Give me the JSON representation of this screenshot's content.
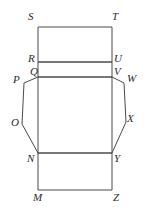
{
  "figure": {
    "stroke_color": "#4a4a4a",
    "label_color": "#2b2b2b",
    "background_color": "#ffffff",
    "stroke_width": 1
  },
  "labels": {
    "S": "S",
    "T": "T",
    "R": "R",
    "U": "U",
    "Q": "Q",
    "V": "V",
    "P": "P",
    "W": "W",
    "O": "O",
    "X": "X",
    "N": "N",
    "Y": "Y",
    "M": "M",
    "Z": "Z"
  },
  "geometry": {
    "left_x": 38,
    "right_x": 112,
    "rows": {
      "ST": 27,
      "RU": 62,
      "QV": 77,
      "NY": 153,
      "MZ": 190
    },
    "left_flap": [
      [
        38,
        77
      ],
      [
        24,
        83
      ],
      [
        22,
        124
      ],
      [
        38,
        153
      ]
    ],
    "right_flap": [
      [
        112,
        77
      ],
      [
        124,
        83
      ],
      [
        126,
        122
      ],
      [
        112,
        153
      ]
    ]
  },
  "label_positions": {
    "S": {
      "x": 28,
      "y": 11
    },
    "T": {
      "x": 112,
      "y": 11
    },
    "R": {
      "x": 28,
      "y": 53
    },
    "U": {
      "x": 114,
      "y": 53
    },
    "Q": {
      "x": 30,
      "y": 66
    },
    "V": {
      "x": 114,
      "y": 66
    },
    "P": {
      "x": 13,
      "y": 74
    },
    "W": {
      "x": 127,
      "y": 73
    },
    "O": {
      "x": 11,
      "y": 117
    },
    "X": {
      "x": 127,
      "y": 113
    },
    "N": {
      "x": 27,
      "y": 153
    },
    "Y": {
      "x": 114,
      "y": 153
    },
    "M": {
      "x": 33,
      "y": 192
    },
    "Z": {
      "x": 113,
      "y": 192
    }
  }
}
